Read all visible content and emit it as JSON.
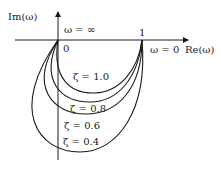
{
  "diagram": {
    "type": "nyquist-plot",
    "y_axis_label": "Im(ω)",
    "x_axis_label": "Re(ω)",
    "origin_label": "0",
    "unit_point_label": "1",
    "omega_inf_label": "ω = ∞",
    "omega_zero_label": "ω = 0",
    "curves": [
      {
        "label": "ζ = 1.0",
        "zeta": 1.0
      },
      {
        "label": "ζ = 0.8",
        "zeta": 0.8
      },
      {
        "label": "ζ = 0.6",
        "zeta": 0.6
      },
      {
        "label": "ζ = 0.4",
        "zeta": 0.4
      }
    ],
    "line_color": "#1a1a1a"
  }
}
